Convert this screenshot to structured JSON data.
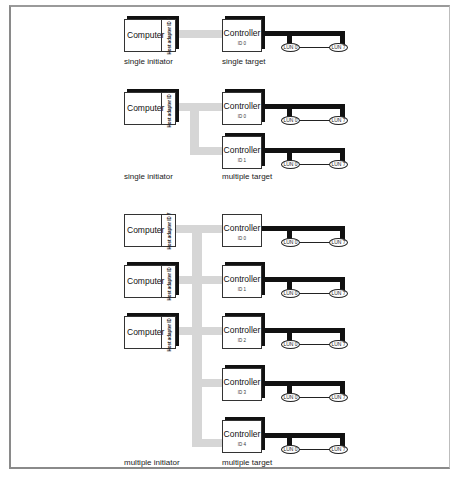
{
  "diagram": {
    "colors": {
      "host_bus": "#d6d6d6",
      "target_bus": "#111111",
      "border": "#8a8a8a"
    },
    "sections": [
      {
        "initiator_caption": "single initiator",
        "target_caption": "single target",
        "computers": [
          {
            "label": "Computer",
            "adapter": "Host adapter",
            "id": "ID 7"
          }
        ],
        "controllers": [
          {
            "label": "Controller",
            "id": "ID 0",
            "luns": [
              "LUN 0",
              "LUN 7"
            ]
          }
        ]
      },
      {
        "initiator_caption": "single initiator",
        "target_caption": "multiple target",
        "computers": [
          {
            "label": "Computer",
            "adapter": "Host adapter",
            "id": "ID 7"
          }
        ],
        "controllers": [
          {
            "label": "Controller",
            "id": "ID 0",
            "luns": [
              "LUN 0",
              "LUN 7"
            ]
          },
          {
            "label": "Controller",
            "id": "ID 1",
            "luns": [
              "LUN 0",
              "LUN 7"
            ]
          }
        ]
      },
      {
        "initiator_caption": "multiple initiator",
        "target_caption": "multiple target",
        "computers": [
          {
            "label": "Computer",
            "adapter": "Host adapter",
            "id": "ID 7"
          },
          {
            "label": "Computer",
            "adapter": "Host adapter",
            "id": "ID 6"
          },
          {
            "label": "Computer",
            "adapter": "Host adapter",
            "id": "ID 5"
          }
        ],
        "controllers": [
          {
            "label": "Controller",
            "id": "ID 0",
            "luns": [
              "LUN 0",
              "LUN 7"
            ]
          },
          {
            "label": "Controller",
            "id": "ID 1",
            "luns": [
              "LUN 0",
              "LUN 7"
            ]
          },
          {
            "label": "Controller",
            "id": "ID 2",
            "luns": [
              "LUN 0",
              "LUN 7"
            ]
          },
          {
            "label": "Controller",
            "id": "ID 3",
            "luns": [
              "LUN 0",
              "LUN 7"
            ]
          },
          {
            "label": "Controller",
            "id": "ID 4",
            "luns": [
              "LUN 0",
              "LUN 7"
            ]
          }
        ]
      }
    ]
  }
}
